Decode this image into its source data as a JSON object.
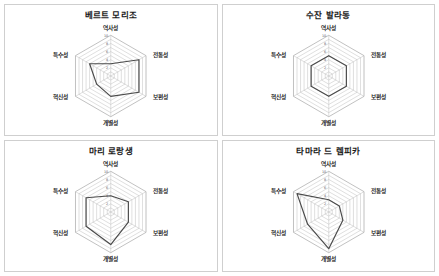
{
  "figure": {
    "layout": "2x2 grid of radar charts",
    "panel_count": 4
  },
  "axes_labels": [
    "역사성",
    "전통성",
    "보편성",
    "개별성",
    "혁신성",
    "특수성"
  ],
  "tick_labels": [
    "10",
    "8",
    "6",
    "4",
    "2"
  ],
  "colors": {
    "series_line": "#4a4a4a",
    "gridline": "#b9b9b9",
    "panel_border": "#cfcfcf",
    "background": "#ffffff",
    "title_text": "#1a1a1a"
  },
  "panels": [
    {
      "title": "베르트 모리조",
      "id": "panel-berthe-morisot"
    },
    {
      "title": "수잔 발라동",
      "id": "panel-suzanne-valadon"
    },
    {
      "title": "마리 로랑생",
      "id": "panel-marie-laurencin"
    },
    {
      "title": "타마라 드 렘피카",
      "id": "panel-tamara-de-lempicka"
    }
  ],
  "chart_data": [
    {
      "type": "radar",
      "title": "베르트 모리조",
      "categories": [
        "역사성",
        "전통성",
        "보편성",
        "개별성",
        "혁신성",
        "특수성"
      ],
      "values": [
        3,
        8,
        8,
        5,
        4,
        6
      ],
      "rlim": [
        0,
        10
      ],
      "rticks": [
        2,
        4,
        6,
        8,
        10
      ],
      "grid": true,
      "legend": "none"
    },
    {
      "type": "radar",
      "title": "수잔 발라동",
      "categories": [
        "역사성",
        "전통성",
        "보편성",
        "개별성",
        "혁신성",
        "특수성"
      ],
      "values": [
        5,
        5,
        5,
        5,
        5,
        5
      ],
      "rlim": [
        0,
        10
      ],
      "rticks": [
        2,
        4,
        6,
        8,
        10
      ],
      "grid": true,
      "legend": "none"
    },
    {
      "type": "radar",
      "title": "마리 로랑생",
      "categories": [
        "역사성",
        "전통성",
        "보편성",
        "개별성",
        "혁신성",
        "특수성"
      ],
      "values": [
        4,
        5,
        5,
        8,
        7,
        7
      ],
      "rlim": [
        0,
        10
      ],
      "rticks": [
        2,
        4,
        6,
        8,
        10
      ],
      "grid": true,
      "legend": "none"
    },
    {
      "type": "radar",
      "title": "타마라 드 렘피카",
      "categories": [
        "역사성",
        "전통성",
        "보편성",
        "개별성",
        "혁신성",
        "특수성"
      ],
      "values": [
        3,
        3,
        4,
        9,
        6,
        9
      ],
      "rlim": [
        0,
        10
      ],
      "rticks": [
        2,
        4,
        6,
        8,
        10
      ],
      "grid": true,
      "legend": "none"
    }
  ]
}
